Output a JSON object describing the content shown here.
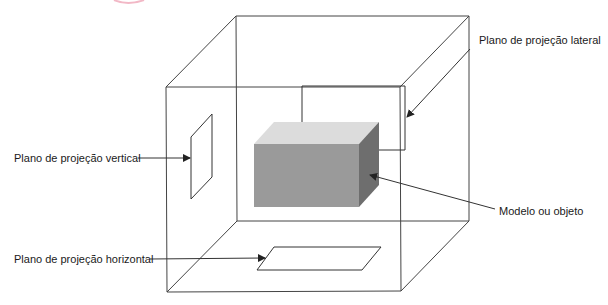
{
  "diagram": {
    "labels": {
      "lateral": "Plano de projeção lateral",
      "vertical": "Plano de projeção vertical",
      "model": "Modelo ou objeto",
      "horizontal": "Plano de projeção horizontal"
    },
    "colors": {
      "line": "#333333",
      "box_front": "#9a9a9a",
      "box_top": "#dcdcdc",
      "box_side": "#6e6e6e",
      "accent_arc": "#f2b8c6"
    }
  }
}
